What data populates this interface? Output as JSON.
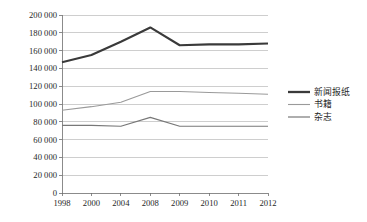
{
  "chart_data": {
    "type": "line",
    "title": "",
    "subtitle": "",
    "xlabel": "",
    "ylabel": "",
    "categories": [
      "1998",
      "2000",
      "2004",
      "2008",
      "2009",
      "2010",
      "2011",
      "2012"
    ],
    "x_tick_labels": [
      "1998",
      "2000",
      "2004",
      "2008",
      "2009",
      "2010",
      "2011",
      "2012"
    ],
    "y_tick_labels": [
      "0",
      "20 000",
      "40 000",
      "60 000",
      "80 000",
      "100 000",
      "120 000",
      "140 000",
      "160 000",
      "180 000",
      "200 000"
    ],
    "y_tick_values": [
      0,
      20000,
      40000,
      60000,
      80000,
      100000,
      120000,
      140000,
      160000,
      180000,
      200000
    ],
    "ylim": [
      0,
      200000
    ],
    "grid": true,
    "grid_axis": "y",
    "legend_position": "right",
    "series": [
      {
        "name": "新闻报纸",
        "color": "#3a3a3a",
        "width": 2.1,
        "values": [
          147000,
          155000,
          170000,
          186000,
          166000,
          167000,
          167000,
          168000
        ]
      },
      {
        "name": "书籍",
        "color": "#9a9a9a",
        "width": 1.1,
        "values": [
          93000,
          97000,
          102000,
          114000,
          114000,
          113000,
          112000,
          111000
        ]
      },
      {
        "name": "杂志",
        "color": "#787878",
        "width": 1.2,
        "values": [
          76000,
          76000,
          75000,
          85000,
          75000,
          75000,
          75000,
          75000
        ]
      }
    ]
  },
  "legend": {
    "items": [
      {
        "label": "新闻报纸",
        "color": "#3a3a3a",
        "width": 2.3
      },
      {
        "label": "书籍",
        "color": "#9a9a9a",
        "width": 1.1
      },
      {
        "label": "杂志",
        "color": "#787878",
        "width": 1.2
      }
    ]
  }
}
